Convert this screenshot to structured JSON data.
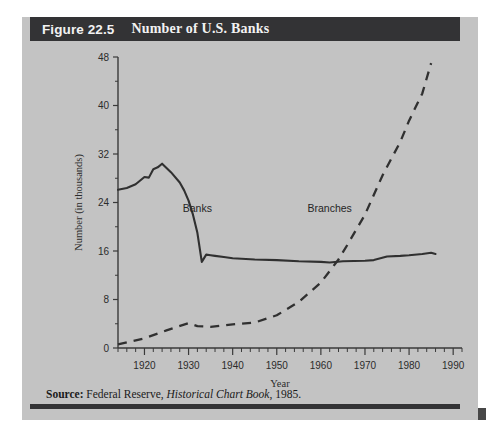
{
  "figure": {
    "number_label": "Figure 22.5",
    "title": "Number of U.S. Banks",
    "source_prefix": "Source:",
    "source_text_1": "Federal Reserve,",
    "source_italic": "Historical Chart Book",
    "source_text_2": ", 1985."
  },
  "colors": {
    "panel_background": "#c3c3c3",
    "header_bar": "#333335",
    "ink": "#303030",
    "page_background": "#ffffff"
  },
  "chart_data": {
    "type": "line",
    "title": "Number of U.S. Banks",
    "xlabel": "Year",
    "ylabel": "Number (in thousands)",
    "xlim": [
      1914,
      1992
    ],
    "ylim": [
      0,
      48
    ],
    "yticks": [
      0,
      8,
      16,
      24,
      32,
      40,
      48
    ],
    "ytick_labels": [
      "0",
      "8",
      "16",
      "24",
      "32",
      "40",
      "48"
    ],
    "xticks": [
      1920,
      1930,
      1940,
      1950,
      1960,
      1970,
      1980,
      1990
    ],
    "xtick_labels": [
      "1920",
      "1930",
      "1940",
      "1950",
      "1960",
      "1970",
      "1980",
      "1990"
    ],
    "xtick_minor_step": 2,
    "grid": false,
    "legend": "inline-annotations",
    "annotations": [
      {
        "text": "Banks",
        "x": 1932,
        "y": 22.5
      },
      {
        "text": "Branches",
        "x": 1962,
        "y": 22.5
      }
    ],
    "series": [
      {
        "name": "Banks",
        "style": "solid",
        "x": [
          1914,
          1916,
          1918,
          1920,
          1921,
          1922,
          1923,
          1924,
          1926,
          1928,
          1929,
          1930,
          1931,
          1932,
          1933,
          1934,
          1935,
          1936,
          1938,
          1940,
          1945,
          1950,
          1955,
          1960,
          1962,
          1965,
          1970,
          1972,
          1975,
          1978,
          1980,
          1983,
          1985,
          1986
        ],
        "y": [
          26.1,
          26.4,
          27.0,
          28.2,
          28.1,
          29.5,
          29.8,
          30.4,
          29.0,
          27.3,
          26.0,
          24.3,
          22.0,
          19.0,
          14.2,
          15.4,
          15.3,
          15.2,
          15.0,
          14.8,
          14.6,
          14.5,
          14.3,
          14.2,
          14.1,
          14.3,
          14.4,
          14.5,
          15.1,
          15.2,
          15.3,
          15.5,
          15.7,
          15.5
        ]
      },
      {
        "name": "Branches",
        "style": "dashed",
        "x": [
          1914,
          1920,
          1925,
          1930,
          1932,
          1935,
          1940,
          1945,
          1950,
          1955,
          1960,
          1964,
          1966,
          1970,
          1974,
          1978,
          1980,
          1983,
          1985
        ],
        "y": [
          0.6,
          1.6,
          2.9,
          4.1,
          3.6,
          3.5,
          3.9,
          4.2,
          5.4,
          7.6,
          10.8,
          14.6,
          17.0,
          22.0,
          28.5,
          34.0,
          37.5,
          42.0,
          47.0
        ]
      }
    ]
  }
}
